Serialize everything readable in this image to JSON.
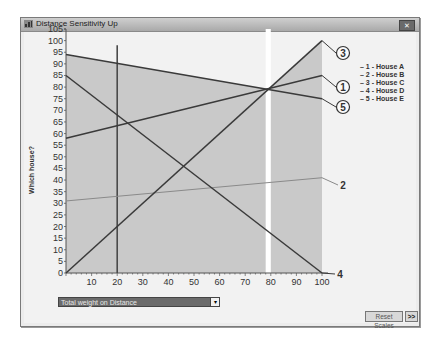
{
  "window": {
    "title": "Distance Sensitivity Up",
    "close_label": "✕"
  },
  "controls": {
    "dropdown_value": "Total weight on Distance",
    "dropdown_arrow": "▾",
    "reset_scales_label": "Reset Scales",
    "more_label": ">>"
  },
  "legend": [
    "1 - House A",
    "2 - House B",
    "3 - House C",
    "4 - House D",
    "5 - House E"
  ],
  "colors": {
    "shade": "#c9c9c9",
    "line_dark": "#3a3a3a",
    "line_light": "#8a8a8a",
    "background": "#f2f2f2",
    "gap": "#ffffff"
  },
  "chart_data": {
    "type": "line",
    "title": "Distance Sensitivity Up",
    "xlabel": "Total weight on Distance",
    "ylabel": "Which house?",
    "xlim": [
      0,
      100
    ],
    "ylim": [
      0,
      105
    ],
    "x_ticks": [
      10,
      20,
      30,
      40,
      50,
      60,
      70,
      80,
      90,
      100
    ],
    "y_ticks": [
      0,
      5,
      10,
      15,
      20,
      25,
      30,
      35,
      40,
      45,
      50,
      55,
      60,
      65,
      70,
      75,
      80,
      85,
      90,
      95,
      100,
      105
    ],
    "current_weight_marker": 20,
    "crossover_gap": [
      78,
      80
    ],
    "shaded_region": {
      "x_from": 0,
      "x_to": 100,
      "upper_envelope": "max of all series"
    },
    "series": [
      {
        "name": "1 - House A",
        "label": "1",
        "x": [
          0,
          100
        ],
        "values": [
          58,
          85
        ],
        "label_style": "circled"
      },
      {
        "name": "2 - House B",
        "label": "2",
        "x": [
          0,
          100
        ],
        "values": [
          31,
          41
        ],
        "label_style": "plain"
      },
      {
        "name": "3 - House C",
        "label": "3",
        "x": [
          0,
          100
        ],
        "values": [
          0,
          100
        ],
        "label_style": "circled"
      },
      {
        "name": "4 - House D",
        "label": "4",
        "x": [
          0,
          100
        ],
        "values": [
          85,
          0
        ],
        "label_style": "plain"
      },
      {
        "name": "5 - House E",
        "label": "5",
        "x": [
          0,
          100
        ],
        "values": [
          94,
          75
        ],
        "label_style": "circled"
      }
    ],
    "grid": false,
    "legend_position": "right"
  }
}
